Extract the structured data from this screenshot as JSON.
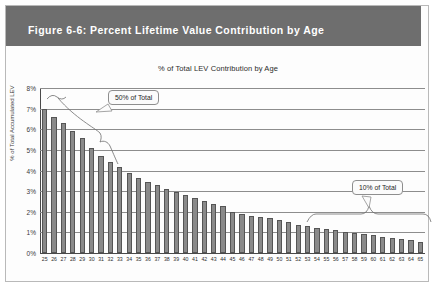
{
  "figure": {
    "caption": "Figure 6-6: Percent Lifetime Value Contribution by Age"
  },
  "chart_data": {
    "type": "bar",
    "title": "% of Total LEV Contribution by Age",
    "xlabel": "",
    "ylabel": "% of Total Accumulated LEV",
    "ylim": [
      0,
      8
    ],
    "yticks": [
      "0%",
      "1%",
      "2%",
      "3%",
      "4%",
      "5%",
      "6%",
      "7%",
      "8%"
    ],
    "grid": true,
    "legend": "none",
    "categories": [
      "25",
      "26",
      "27",
      "28",
      "29",
      "30",
      "31",
      "32",
      "33",
      "34",
      "35",
      "36",
      "37",
      "38",
      "39",
      "40",
      "41",
      "42",
      "43",
      "44",
      "45",
      "46",
      "47",
      "48",
      "49",
      "50",
      "51",
      "52",
      "53",
      "54",
      "55",
      "56",
      "57",
      "58",
      "59",
      "60",
      "61",
      "62",
      "63",
      "64",
      "65"
    ],
    "values": [
      7.0,
      6.6,
      6.3,
      5.9,
      5.6,
      5.1,
      4.7,
      4.4,
      4.15,
      3.9,
      3.65,
      3.45,
      3.3,
      3.1,
      2.95,
      2.8,
      2.65,
      2.5,
      2.4,
      2.3,
      2.0,
      1.9,
      1.8,
      1.75,
      1.7,
      1.6,
      1.5,
      1.35,
      1.3,
      1.2,
      1.15,
      1.1,
      1.0,
      0.95,
      0.9,
      0.85,
      0.8,
      0.75,
      0.7,
      0.65,
      0.55
    ],
    "annotations": [
      {
        "label": "50% of Total",
        "covers": "ages 25 to 36"
      },
      {
        "label": "10% of Total",
        "covers": "ages 55 to 65"
      }
    ]
  }
}
